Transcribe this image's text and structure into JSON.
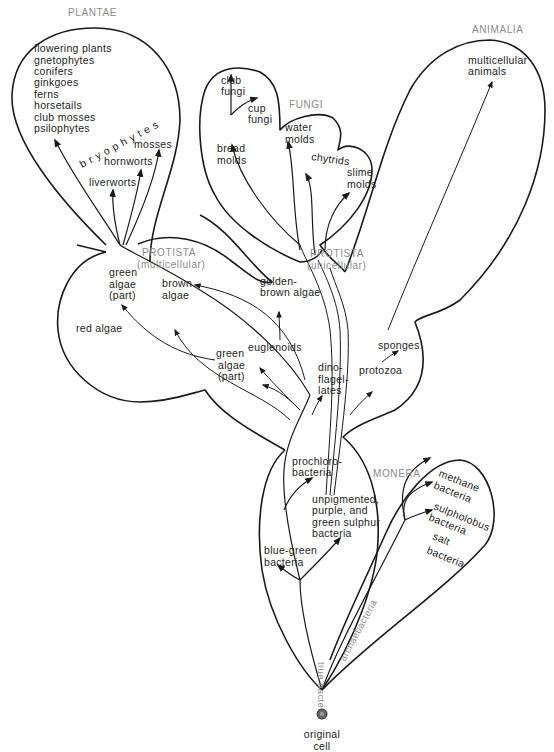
{
  "diagram": {
    "kingdoms": {
      "plantae": "PLANTAE",
      "fungi": "FUNGI",
      "animalia": "ANIMALIA",
      "protista_multicellular": [
        "PROTISTA",
        "(multicellular)"
      ],
      "protista_unicellular": [
        "PROTISTA",
        "(unicellular)"
      ],
      "monera": "MONERA"
    },
    "plantae": {
      "list": [
        "flowering plants",
        "gnetophytes",
        "conifers",
        "ginkgoes",
        "ferns",
        "horsetails",
        "club mosses",
        "psilophytes"
      ],
      "bryophytes": "bryophytes",
      "mosses": "mosses",
      "hornworts": "hornworts",
      "liverworts": "liverworts"
    },
    "fungi": {
      "club_fungi": [
        "club",
        "fungi"
      ],
      "cup_fungi": [
        "cup",
        "fungi"
      ],
      "bread_molds": [
        "bread",
        "molds"
      ],
      "water_molds": [
        "water",
        "molds"
      ],
      "chytrids": "chytrids",
      "slime_molds": [
        "slime",
        "molds"
      ]
    },
    "animalia": {
      "multicellular_animals": [
        "multicellular",
        "animals"
      ]
    },
    "protista": {
      "green_algae_part_1": [
        "green",
        "algae",
        "(part)"
      ],
      "brown_algae": [
        "brown",
        "algae"
      ],
      "golden_brown_algae": [
        "golden-",
        "brown algae"
      ],
      "red_algae": "red algae",
      "green_algae_part_2": [
        "green",
        "algae",
        "(part)"
      ],
      "euglenoids": "euglenoids",
      "dinoflagellates": [
        "dino-",
        "flagel-",
        "lates"
      ],
      "protozoa": "protozoa",
      "sponges": "sponges"
    },
    "monera": {
      "prochlorobacteria": [
        "prochloro-",
        "bacteria"
      ],
      "unpigmented": [
        "unpigmented,",
        "purple, and",
        "green sulphur",
        "bacteria"
      ],
      "blue_green": [
        "blue-green",
        "bacteria"
      ],
      "methane": [
        "methane",
        "bacteria"
      ],
      "sulpholobus": [
        "sulpholobus",
        "bacteria"
      ],
      "salt": [
        "salt",
        "bacteria"
      ],
      "true_bacteria": "true bacteria",
      "archaebacteria": "archaebacteria"
    },
    "root": {
      "label": [
        "original",
        "cell"
      ]
    },
    "colors": {
      "line": "#1a1a1a",
      "text": "#222222",
      "kingdom_label": "#8a8a8a"
    }
  }
}
